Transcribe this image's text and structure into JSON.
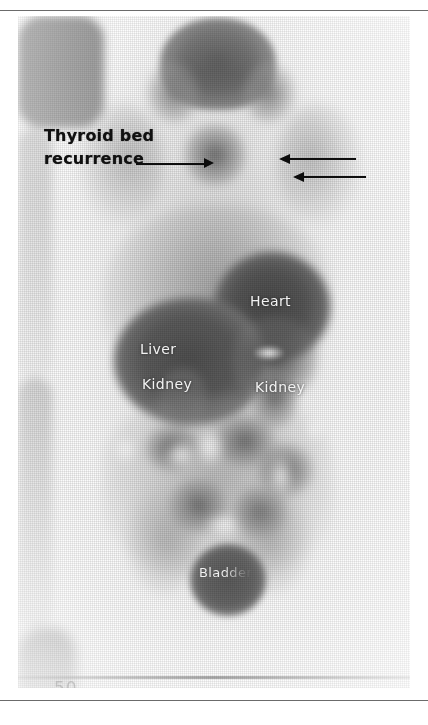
{
  "figure": {
    "modality": "whole-body radioiodine (I-131) scintigraphy scan",
    "view": "anterior whole-body planar image"
  },
  "rules": {
    "top": "page-rule-top",
    "bottom": "page-rule-bottom"
  },
  "annotations": {
    "callout": {
      "text": "Thyroid bed\nrecurrence",
      "line1": "Thyroid bed",
      "line2": "recurrence",
      "leader_direction": "right",
      "color": "#0d0d0d"
    },
    "marker_arrows": [
      {
        "id": "arrow-1",
        "direction": "left",
        "color": "#0d0d0d"
      },
      {
        "id": "arrow-2",
        "direction": "left",
        "color": "#0d0d0d"
      }
    ]
  },
  "organ_labels": [
    {
      "id": "heart",
      "text": "Heart"
    },
    {
      "id": "liver",
      "text": "Liver"
    },
    {
      "id": "kidney-left",
      "text": "Kidney"
    },
    {
      "id": "kidney-right",
      "text": "Kidney"
    },
    {
      "id": "bladder",
      "text": "Bladder"
    }
  ],
  "scale_marker": {
    "text": "50"
  },
  "colors": {
    "page_background": "#ffffff",
    "rule": "#6b6b6b",
    "annotation_text": "#111111",
    "organ_label_text": "#f2f2f2",
    "scan_hot": "#4a4a4a",
    "scan_background": "#fbfbfb"
  }
}
